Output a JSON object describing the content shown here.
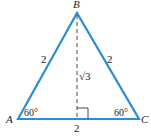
{
  "diagram": {
    "type": "equilateral triangle with altitude",
    "vertices": {
      "A": {
        "label": "A",
        "angle": "60°"
      },
      "B": {
        "label": "B"
      },
      "C": {
        "label": "C",
        "angle": "60°"
      }
    },
    "sides": {
      "AB": "2",
      "BC": "2",
      "AC": "2"
    },
    "altitude": {
      "label": "√3",
      "from": "B",
      "right_angle_marker": true
    },
    "colors": {
      "triangle": "#2a8fd0",
      "text": "#222222"
    }
  }
}
